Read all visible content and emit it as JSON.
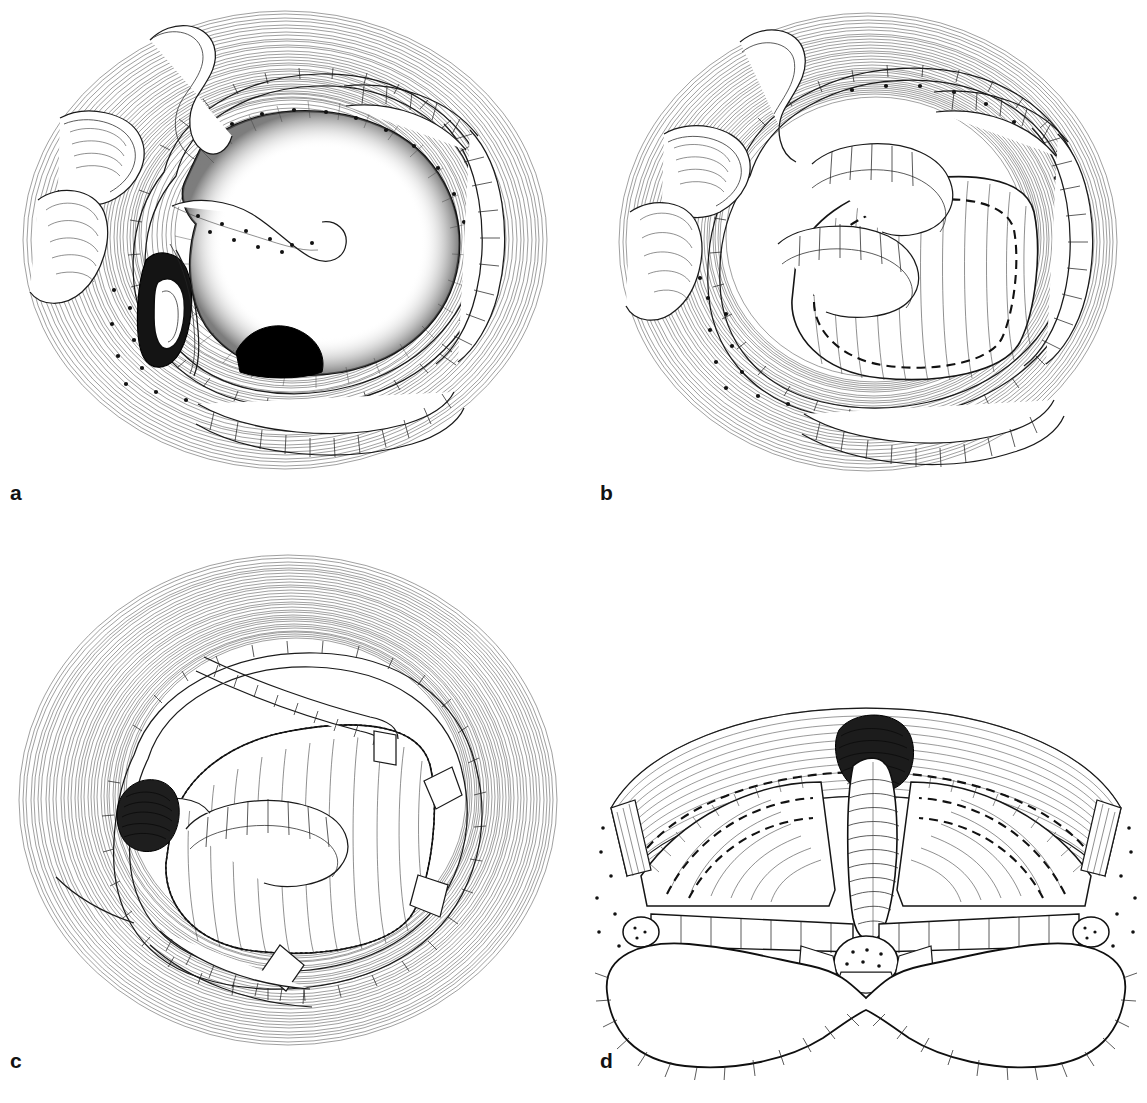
{
  "plate": {
    "title": "Four-panel surgical anatomy plate",
    "background_color": "#ffffff",
    "ink_color": "#1a1a1a",
    "medium": "pen-and-ink line drawing",
    "width": 1147,
    "height": 1103
  },
  "panels": [
    {
      "id": "a",
      "label": "a",
      "view": "circular operative field, superior/intra-abdominal view",
      "stage": "defect exposed before repair",
      "features": [
        "concentric radiating hatch field surrounding the operative circle",
        "open central defect with radiating feathered margin",
        "tubular looped structure entering from upper left",
        "segmented banded ring encircling the opening",
        "solid black ovoid shadow at lower margin of the defect",
        "stipple-dotted peritoneal surface at lower left",
        "dark shaded cleft with inner lumen at left of the defect"
      ]
    },
    {
      "id": "b",
      "label": "b",
      "view": "circular operative field, same orientation as panel a",
      "stage": "mesh positioned over the defect, dashed suture line marked",
      "features": [
        "large quadrilateral mesh sheet with parallel vertical hatching",
        "heavy dashed outline indicating planned suture line",
        "folded tubular loop overlying the mesh at upper left",
        "segmented banded ring around the periphery",
        "stipple-dotted surface at lower left",
        "concentric radiating hatch field surrounding the operative circle"
      ]
    },
    {
      "id": "c",
      "label": "c",
      "view": "circular operative field, same orientation as panels a and b",
      "stage": "mesh fixed in place, repair completed",
      "features": [
        "quadrilateral mesh with parallel hatching secured at its margins",
        "continuous fine suture stitching along mesh border",
        "tubular loop lying over the lower left of the mesh",
        "dark shaded mass at mid-left margin",
        "retractor-like band crossing the upper margin",
        "concentric radiating hatch field filling the surround"
      ]
    },
    {
      "id": "d",
      "label": "d",
      "view": "coronal cross-section through the repaired region",
      "stage": "cross-sectional view of the completed repair",
      "features": [
        "arched upper tissue band with long parallel hatching",
        "bilateral symmetric mesh wings with dashed suture outlines",
        "dark vertical midline structure with transverse banding",
        "dark irregular mass at the superior midline",
        "three rounded nodular structures along the transverse bar",
        "large lobulated cavity below with short radiating hairs along its border",
        "sparse stipple dots flanking both lateral edges"
      ]
    }
  ]
}
